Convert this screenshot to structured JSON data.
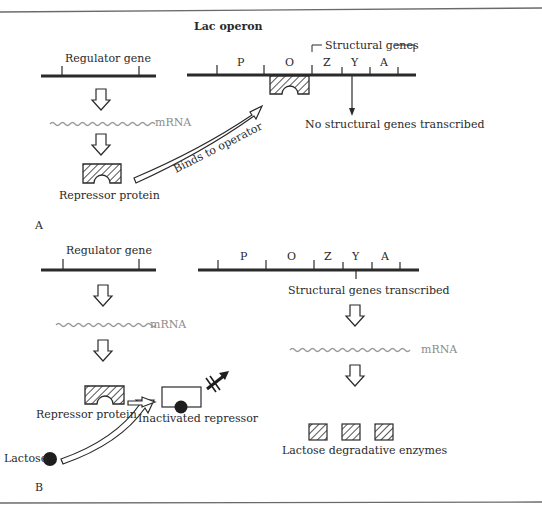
{
  "title": "Lac operon",
  "colors": {
    "ink": "#2a2a2a",
    "mrna": "#9a9a9a",
    "rule": "#6a6a6a",
    "background": "#ffffff"
  },
  "panel_a": {
    "panel_label": "A",
    "regulator_gene": "Regulator gene",
    "mrna": "mRNA",
    "repressor_protein": "Repressor protein",
    "binds_label": "Binds to operator",
    "structural_genes_bracket": "Structural genes",
    "operon_segments": [
      "P",
      "O",
      "Z",
      "Y",
      "A"
    ],
    "outcome": "No structural genes transcribed"
  },
  "panel_b": {
    "panel_label": "B",
    "regulator_gene": "Regulator gene",
    "mrna_left": "mRNA",
    "repressor_protein": "Repressor protein",
    "lactose": "Lactose",
    "inactivated_repressor": "Inactivated repressor",
    "operon_segments": [
      "P",
      "O",
      "Z",
      "Y",
      "A"
    ],
    "outcome": "Structural genes transcribed",
    "mrna_right": "mRNA",
    "enzymes": "Lactose degradative enzymes"
  }
}
